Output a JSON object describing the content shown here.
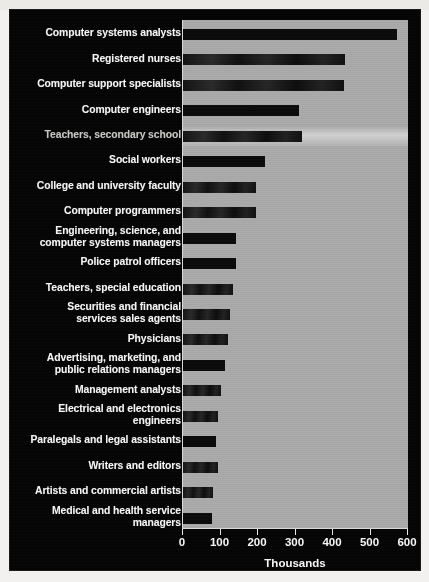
{
  "chart_data": {
    "type": "bar",
    "orientation": "horizontal",
    "title": "",
    "xlabel": "Thousands",
    "ylabel": "",
    "xlim": [
      0,
      600
    ],
    "xticks": [
      0,
      100,
      200,
      300,
      400,
      500,
      600
    ],
    "grid": false,
    "legend": null,
    "categories": [
      "Computer systems analysts",
      "Registered nurses",
      "Computer support specialists",
      "Computer engineers",
      "Teachers, secondary school",
      "Social workers",
      "College and university faculty",
      "Computer programmers",
      "Engineering, science, and computer systems managers",
      "Police patrol officers",
      "Teachers, special education",
      "Securities and financial services sales agents",
      "Physicians",
      "Advertising, marketing, and public relations managers",
      "Management analysts",
      "Electrical and electronics engineers",
      "Paralegals and legal assistants",
      "Writers and editors",
      "Artists and commercial artists",
      "Medical and health service managers"
    ],
    "values": [
      570,
      433,
      430,
      309,
      317,
      218,
      194,
      194,
      142,
      140,
      134,
      124,
      121,
      113,
      102,
      94,
      88,
      94,
      81,
      78
    ],
    "bar_color": "#0b0b0b",
    "plot_background": "#a9a9a9",
    "figure_background": "#050505",
    "text_color": "#f4f4f4"
  },
  "rows": [
    {
      "label_lines": [
        "Computer systems analysts"
      ],
      "value": 570
    },
    {
      "label_lines": [
        "Registered nurses"
      ],
      "value": 433
    },
    {
      "label_lines": [
        "Computer support specialists"
      ],
      "value": 430
    },
    {
      "label_lines": [
        "Computer engineers"
      ],
      "value": 309
    },
    {
      "label_lines": [
        "Teachers, secondary school"
      ],
      "value": 317
    },
    {
      "label_lines": [
        "Social workers"
      ],
      "value": 218
    },
    {
      "label_lines": [
        "College and university faculty"
      ],
      "value": 194
    },
    {
      "label_lines": [
        "Computer programmers"
      ],
      "value": 194
    },
    {
      "label_lines": [
        "Engineering, science, and",
        "computer systems managers"
      ],
      "value": 142
    },
    {
      "label_lines": [
        "Police patrol officers"
      ],
      "value": 140
    },
    {
      "label_lines": [
        "Teachers, special education"
      ],
      "value": 134
    },
    {
      "label_lines": [
        "Securities and financial",
        "services sales agents"
      ],
      "value": 124
    },
    {
      "label_lines": [
        "Physicians"
      ],
      "value": 121
    },
    {
      "label_lines": [
        "Advertising, marketing, and",
        "public relations managers"
      ],
      "value": 113
    },
    {
      "label_lines": [
        "Management analysts"
      ],
      "value": 102
    },
    {
      "label_lines": [
        "Electrical and electronics",
        "engineers"
      ],
      "value": 94
    },
    {
      "label_lines": [
        "Paralegals and legal assistants"
      ],
      "value": 88
    },
    {
      "label_lines": [
        "Writers and editors"
      ],
      "value": 94
    },
    {
      "label_lines": [
        "Artists and commercial artists"
      ],
      "value": 81
    },
    {
      "label_lines": [
        "Medical and health service",
        "managers"
      ],
      "value": 78
    }
  ],
  "axis": {
    "ticks": [
      "0",
      "100",
      "200",
      "300",
      "400",
      "500",
      "600"
    ],
    "title": "Thousands"
  }
}
